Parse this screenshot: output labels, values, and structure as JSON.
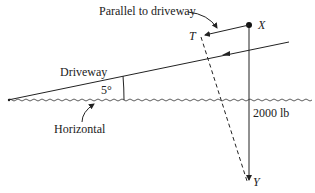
{
  "diagram": {
    "type": "force-diagram",
    "labels": {
      "parallel": "Parallel to driveway",
      "point_x": "X",
      "point_t": "T",
      "point_y": "Y",
      "driveway": "Driveway",
      "angle": "5°",
      "horizontal": "Horizontal",
      "weight": "2000 lb"
    },
    "colors": {
      "line": "#222222",
      "background": "#ffffff"
    }
  }
}
